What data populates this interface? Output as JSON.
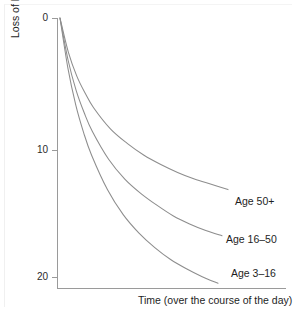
{
  "chart_data": {
    "type": "line",
    "title": "",
    "xlabel": "Time (over the course of the day)",
    "ylabel": "Loss of height (mm)",
    "x": [
      0,
      0.5,
      1,
      1.5,
      2,
      3,
      4,
      5,
      6,
      7,
      8,
      9,
      10
    ],
    "xlim": [
      0,
      10
    ],
    "ylim": [
      0,
      21.5
    ],
    "y_inverted": true,
    "yticks": [
      0,
      10,
      20
    ],
    "ytick_labels": [
      "0",
      "10",
      "20"
    ],
    "xticks": [],
    "xtick_labels": [],
    "grid": false,
    "legend_position": "right-inline-labels",
    "axis_color": "#9a9a9a",
    "curve_color": "#8d8d8d",
    "series": [
      {
        "name": "Age 50+",
        "label": "Age 50+",
        "values": [
          0,
          2.6,
          4.4,
          5.7,
          6.8,
          8.4,
          9.5,
          10.4,
          11.1,
          11.7,
          12.2,
          12.6,
          13.0
        ]
      },
      {
        "name": "Age 16-50",
        "label": "Age 16–50",
        "values": [
          0,
          3.2,
          5.5,
          7.2,
          8.6,
          10.7,
          12.2,
          13.3,
          14.2,
          15.0,
          15.6,
          16.1,
          16.5
        ]
      },
      {
        "name": "Age 3-16",
        "label": "Age 3–16",
        "values": [
          0,
          3.8,
          6.6,
          8.7,
          10.4,
          13.0,
          14.9,
          16.3,
          17.4,
          18.3,
          19.0,
          19.6,
          20.1
        ]
      }
    ]
  },
  "axis": {
    "ytick_0": "0",
    "ytick_10": "10",
    "ytick_20": "20",
    "ylabel": "Loss of height (mm)",
    "xlabel": "Time (over the course of the day)"
  },
  "labels": {
    "age_50_plus": "Age 50+",
    "age_16_50": "Age 16–50",
    "age_3_16": "Age 3–16"
  }
}
